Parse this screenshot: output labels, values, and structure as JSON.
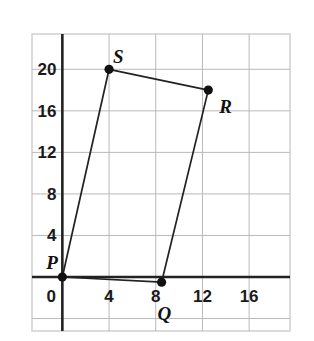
{
  "figure": {
    "kind": "coordinate-plane-quadrilateral",
    "background_color": "#ffffff"
  },
  "chart_data": {
    "type": "scatter",
    "title": "",
    "xlabel": "",
    "ylabel": "",
    "xlim": [
      -2.6,
      19.5
    ],
    "ylim": [
      -5.2,
      23.4
    ],
    "grid": true,
    "grid_step": 4,
    "legend_position": "none",
    "xticks": [
      0,
      4,
      8,
      12,
      16
    ],
    "xtick_labels": [
      "0",
      "4",
      "8",
      "12",
      "16"
    ],
    "yticks": [
      4,
      8,
      12,
      16,
      20
    ],
    "ytick_labels": [
      "4",
      "8",
      "12",
      "16",
      "20"
    ],
    "axis_color": "#222222",
    "grid_color": "#b9b9b9",
    "series": [
      {
        "name": "Quadrilateral PQRS",
        "closed": true,
        "line_color": "#222222",
        "marker_color": "#111111",
        "points": [
          {
            "label": "P",
            "x": 0,
            "y": 0,
            "label_dx": -16,
            "label_dy": -24
          },
          {
            "label": "Q",
            "x": 8.5,
            "y": -0.5,
            "label_dx": -4,
            "label_dy": 22
          },
          {
            "label": "R",
            "x": 12.5,
            "y": 18,
            "label_dx": 11,
            "label_dy": 7
          },
          {
            "label": "S",
            "x": 4,
            "y": 20,
            "label_dx": 4,
            "label_dy": -22
          }
        ]
      }
    ]
  },
  "frame": {
    "border_color": "#cccccc",
    "left": 32,
    "top": 34,
    "right": 290,
    "bottom": 331
  }
}
